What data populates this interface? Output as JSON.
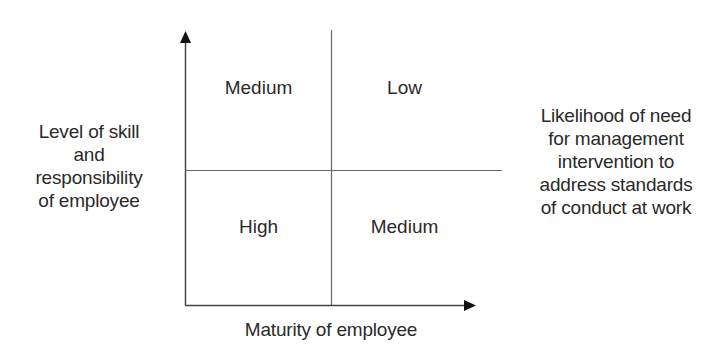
{
  "diagram": {
    "y_axis_label": [
      "Level of skill",
      "and",
      "responsibility",
      "of employee"
    ],
    "x_axis_label": "Maturity of employee",
    "right_label": [
      "Likelihood of need",
      "for management",
      "intervention to",
      "address standards",
      "of conduct at work"
    ],
    "quadrants": {
      "top_left": "Medium",
      "top_right": "Low",
      "bottom_left": "High",
      "bottom_right": "Medium"
    },
    "colors": {
      "line": "#555555",
      "arrow": "#111111",
      "text": "#2a2a2a"
    }
  }
}
